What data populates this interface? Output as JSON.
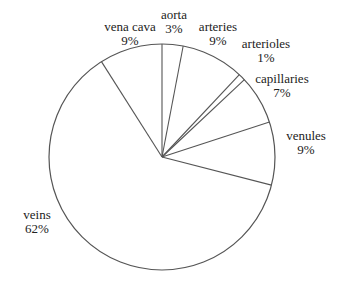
{
  "chart_data": {
    "type": "pie",
    "title": "",
    "start_angle_deg": 0,
    "direction": "clockwise",
    "categories": [
      "aorta",
      "arteries",
      "arterioles",
      "capillaries",
      "venules",
      "veins",
      "vena cava"
    ],
    "values": [
      3,
      9,
      1,
      7,
      9,
      62,
      9
    ],
    "unit": "%",
    "labels": [
      {
        "name": "aorta",
        "pct": "3%",
        "x": 174,
        "y": 19
      },
      {
        "name": "arteries",
        "pct": "9%",
        "x": 218,
        "y": 31
      },
      {
        "name": "arterioles",
        "pct": "1%",
        "x": 266,
        "y": 48
      },
      {
        "name": "capillaries",
        "pct": "7%",
        "x": 282,
        "y": 83
      },
      {
        "name": "venules",
        "pct": "9%",
        "x": 306,
        "y": 140
      },
      {
        "name": "veins",
        "pct": "62%",
        "x": 37,
        "y": 219
      },
      {
        "name": "vena cava",
        "pct": "9%",
        "x": 130,
        "y": 31
      }
    ],
    "style": {
      "stroke": "#555555",
      "fill": "#ffffff",
      "text": "#222222"
    },
    "geometry": {
      "cx": 162,
      "cy": 157,
      "r": 113
    }
  }
}
